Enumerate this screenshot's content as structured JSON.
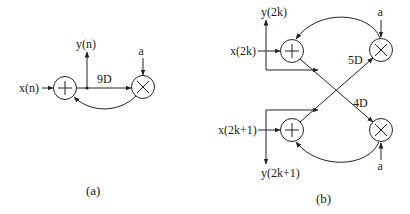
{
  "diagram_a": {
    "caption": "(a)",
    "input": "x(n)",
    "output": "y(n)",
    "delay": "9D",
    "coefficient": "a",
    "nodes": [
      {
        "type": "adder",
        "symbol": "+"
      },
      {
        "type": "multiplier",
        "symbol": "×"
      }
    ]
  },
  "diagram_b": {
    "caption": "(b)",
    "inputs": [
      "x(2k)",
      "x(2k+1)"
    ],
    "outputs": [
      "y(2k)",
      "y(2k+1)"
    ],
    "delays": [
      "5D",
      "4D"
    ],
    "coefficients": [
      "a",
      "a"
    ],
    "nodes": [
      {
        "type": "adder",
        "symbol": "+",
        "position": "top"
      },
      {
        "type": "multiplier",
        "symbol": "×",
        "position": "top"
      },
      {
        "type": "adder",
        "symbol": "+",
        "position": "bottom"
      },
      {
        "type": "multiplier",
        "symbol": "×",
        "position": "bottom"
      }
    ]
  }
}
